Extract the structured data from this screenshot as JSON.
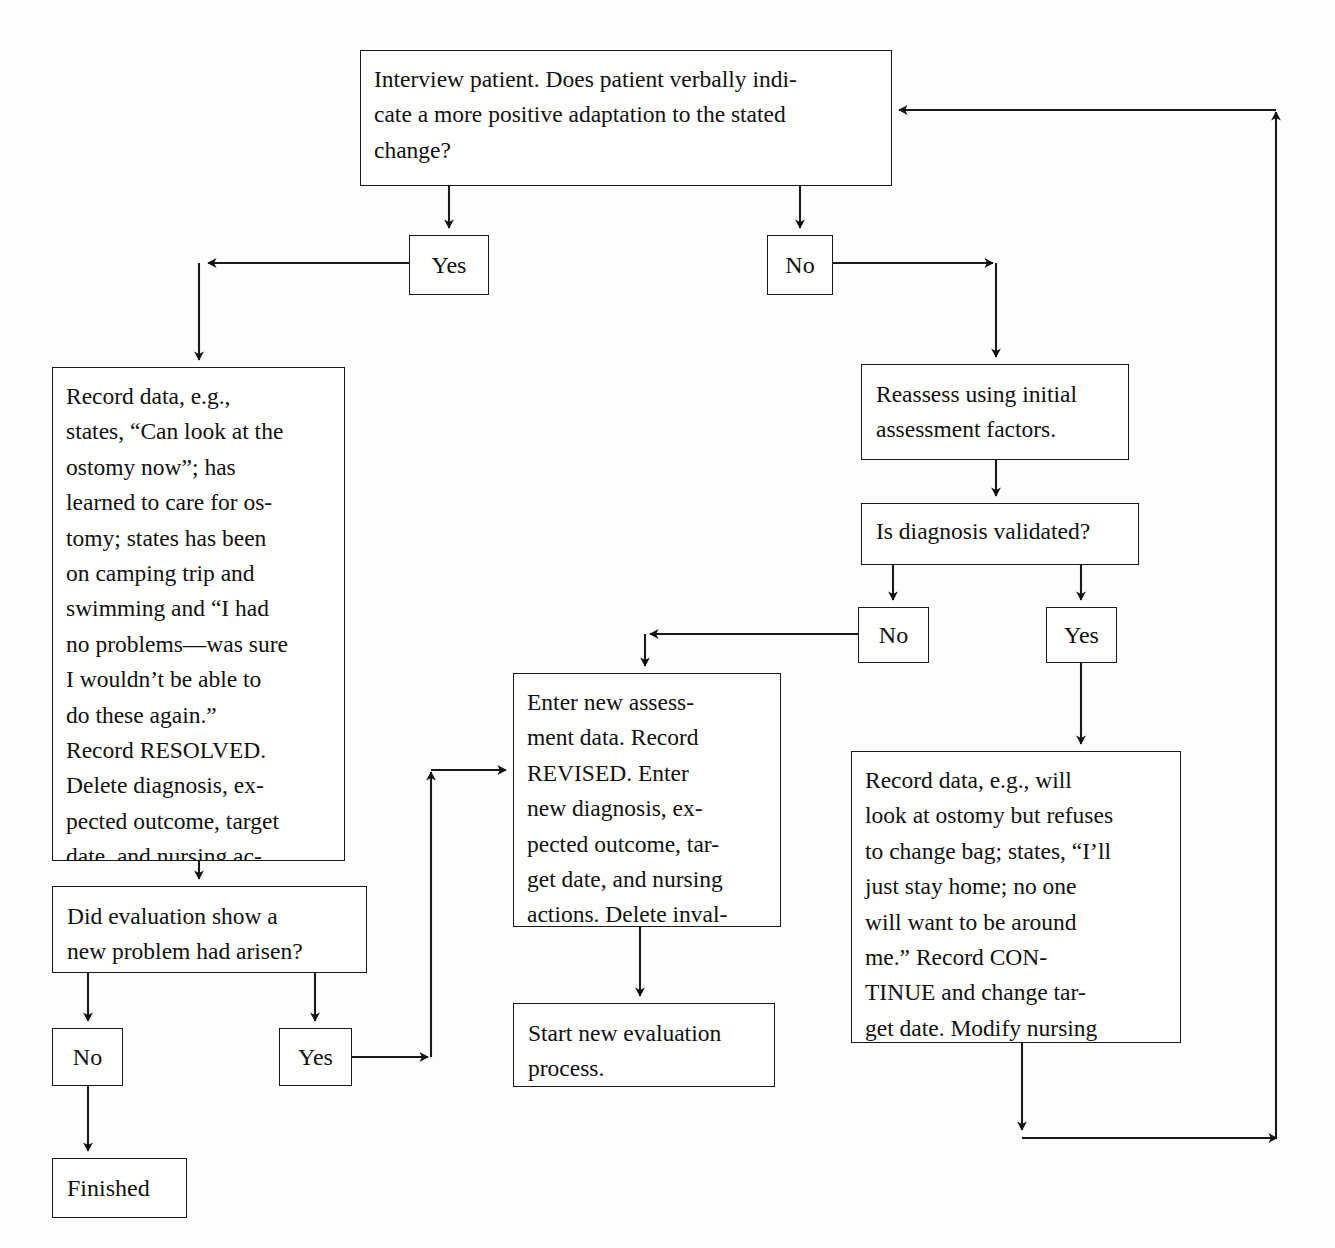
{
  "diagram": {
    "type": "flowchart",
    "background_color": "#fdfdfc",
    "line_color": "#1a1a1a",
    "text_color": "#111111",
    "nodes": {
      "interview": {
        "id": "interview",
        "shape": "rect",
        "text": "Interview patient. Does patient verbally indi-\ncate a more positive adaptation to the stated\nchange?",
        "x": 360,
        "y": 50,
        "w": 532,
        "h": 136
      },
      "yes_top": {
        "id": "yes-top",
        "shape": "rect",
        "text": "Yes",
        "x": 409,
        "y": 235,
        "w": 80,
        "h": 60
      },
      "no_top": {
        "id": "no-top",
        "shape": "rect",
        "text": "No",
        "x": 767,
        "y": 235,
        "w": 66,
        "h": 60
      },
      "record_resolved": {
        "id": "record-resolved",
        "shape": "rect",
        "text": "Record data, e.g.,\nstates, “Can look at the\nostomy now”; has\nlearned to care for os-\ntomy; states has been\non camping trip and\nswimming and “I had\nno problems—was sure\nI wouldn’t be able to\ndo these again.”\nRecord RESOLVED.\nDelete diagnosis, ex-\npected outcome, target\ndate, and nursing ac-\ntions.",
        "x": 52,
        "y": 367,
        "w": 293,
        "h": 494
      },
      "reassess": {
        "id": "reassess",
        "shape": "rect",
        "text": "Reassess using initial\nassessment factors.",
        "x": 861,
        "y": 364,
        "w": 268,
        "h": 96
      },
      "is_validated": {
        "id": "is-diagnosis-validated",
        "shape": "rect",
        "text": "Is diagnosis validated?",
        "x": 861,
        "y": 503,
        "w": 278,
        "h": 62
      },
      "no_validated": {
        "id": "no-validated",
        "shape": "rect",
        "text": "No",
        "x": 858,
        "y": 607,
        "w": 71,
        "h": 56
      },
      "yes_validated": {
        "id": "yes-validated",
        "shape": "rect",
        "text": "Yes",
        "x": 1046,
        "y": 607,
        "w": 71,
        "h": 56
      },
      "enter_new": {
        "id": "enter-new-assessment",
        "shape": "rect",
        "text": "Enter new assess-\nment data. Record\nREVISED. Enter\nnew diagnosis, ex-\npected outcome, tar-\nget date, and nursing\nactions. Delete inval-\nidated diagnosis.",
        "x": 513,
        "y": 673,
        "w": 268,
        "h": 254
      },
      "record_continue": {
        "id": "record-continue",
        "shape": "rect",
        "text": "Record data, e.g., will\nlook at ostomy but refuses\nto change bag; states, “I’ll\njust stay home; no one\nwill want to be around\nme.” Record CON-\nTINUE and change tar-\nget date. Modify nursing\nactions as necessary.",
        "x": 851,
        "y": 751,
        "w": 330,
        "h": 292
      },
      "did_eval": {
        "id": "did-evaluation-show-new-problem",
        "shape": "rect",
        "text": "Did evaluation show a\nnew problem had arisen?",
        "x": 52,
        "y": 886,
        "w": 315,
        "h": 87
      },
      "no_bottom": {
        "id": "no-bottom",
        "shape": "rect",
        "text": "No",
        "x": 52,
        "y": 1028,
        "w": 71,
        "h": 58
      },
      "yes_bottom": {
        "id": "yes-bottom",
        "shape": "rect",
        "text": "Yes",
        "x": 279,
        "y": 1028,
        "w": 73,
        "h": 58
      },
      "start_new": {
        "id": "start-new-evaluation",
        "shape": "rect",
        "text": "Start new evaluation\nprocess.",
        "x": 513,
        "y": 1003,
        "w": 262,
        "h": 84
      },
      "finished": {
        "id": "finished",
        "shape": "rect",
        "text": "Finished",
        "x": 52,
        "y": 1158,
        "w": 135,
        "h": 60
      }
    },
    "edges": [
      {
        "from": "interview",
        "to": "yes_top",
        "label": ""
      },
      {
        "from": "interview",
        "to": "no_top",
        "label": ""
      },
      {
        "from": "yes_top",
        "to": "record_resolved",
        "label": ""
      },
      {
        "from": "no_top",
        "to": "reassess",
        "label": ""
      },
      {
        "from": "reassess",
        "to": "is_validated",
        "label": ""
      },
      {
        "from": "is_validated",
        "to": "no_validated",
        "label": ""
      },
      {
        "from": "is_validated",
        "to": "yes_validated",
        "label": ""
      },
      {
        "from": "no_validated",
        "to": "enter_new",
        "label": ""
      },
      {
        "from": "yes_validated",
        "to": "record_continue",
        "label": ""
      },
      {
        "from": "record_resolved",
        "to": "did_eval",
        "label": ""
      },
      {
        "from": "did_eval",
        "to": "no_bottom",
        "label": ""
      },
      {
        "from": "did_eval",
        "to": "yes_bottom",
        "label": ""
      },
      {
        "from": "yes_bottom",
        "to": "enter_new",
        "label": ""
      },
      {
        "from": "enter_new",
        "to": "start_new",
        "label": ""
      },
      {
        "from": "no_bottom",
        "to": "finished",
        "label": ""
      },
      {
        "from": "record_continue",
        "to": "interview",
        "label": ""
      }
    ]
  }
}
